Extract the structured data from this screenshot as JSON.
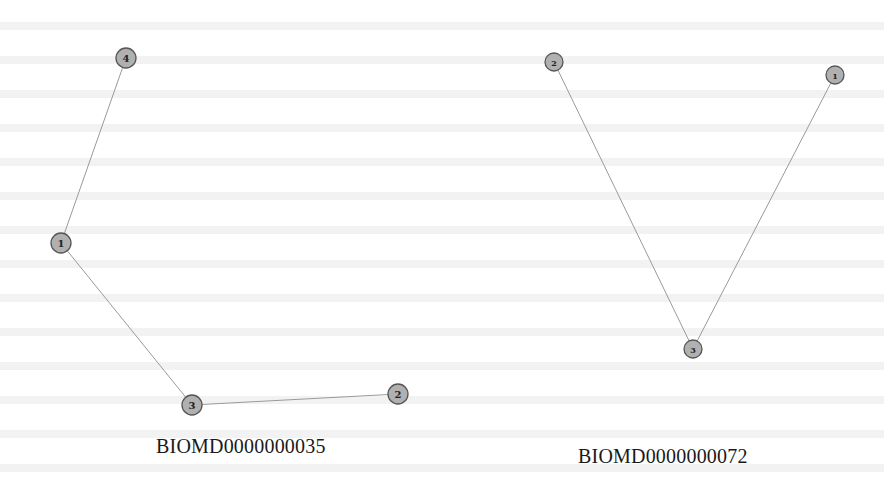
{
  "colors": {
    "background": "#ffffff",
    "node_fill": "#b0b0b0",
    "node_stroke": "#555555",
    "edge": "#9a9a9a",
    "label": "#222222"
  },
  "graphs": [
    {
      "caption": "BIOMD0000000035",
      "caption_pos": {
        "x": 156,
        "y": 435
      },
      "node_radius": 10,
      "nodes": [
        {
          "id": "4",
          "x": 126,
          "y": 58
        },
        {
          "id": "1",
          "x": 61,
          "y": 243
        },
        {
          "id": "3",
          "x": 192,
          "y": 405
        },
        {
          "id": "2",
          "x": 398,
          "y": 394
        }
      ],
      "edges": [
        [
          "4",
          "1"
        ],
        [
          "1",
          "3"
        ],
        [
          "3",
          "2"
        ]
      ]
    },
    {
      "caption": "BIOMD0000000072",
      "caption_pos": {
        "x": 578,
        "y": 445
      },
      "node_radius": 9,
      "nodes": [
        {
          "id": "2",
          "x": 554,
          "y": 62
        },
        {
          "id": "1",
          "x": 835,
          "y": 75
        },
        {
          "id": "3",
          "x": 693,
          "y": 349
        }
      ],
      "edges": [
        [
          "2",
          "3"
        ],
        [
          "1",
          "3"
        ]
      ]
    }
  ]
}
